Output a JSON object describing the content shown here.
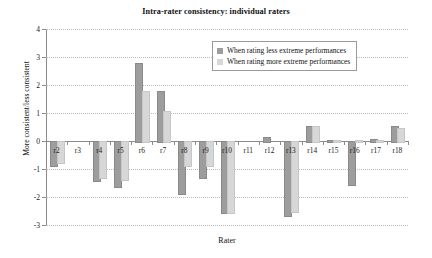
{
  "chart_data": {
    "type": "bar",
    "title": "Intra-rater consistency: individual raters",
    "xlabel": "Rater",
    "ylabel": "More consistent/less consistent",
    "ylim": [
      -3,
      4
    ],
    "yticks": [
      4,
      3,
      2,
      1,
      0,
      -1,
      -2,
      -3
    ],
    "ytick_labels": [
      "4",
      "3",
      "2",
      "1",
      "0",
      "-1",
      "-2",
      "-3"
    ],
    "grid": true,
    "legend_position": "upper-right-inside",
    "categories": [
      "r2",
      "r3",
      "r4",
      "r5",
      "r6",
      "r7",
      "r8",
      "r9",
      "r10",
      "r11",
      "r12",
      "r13",
      "r14",
      "r15",
      "r16",
      "r17",
      "r18"
    ],
    "series": [
      {
        "name": "When rating less extreme performances",
        "color": "#9d9d9d",
        "values": [
          -0.85,
          0,
          -1.4,
          -1.6,
          2.78,
          1.8,
          -1.85,
          -1.3,
          -2.55,
          0,
          0.15,
          -2.65,
          0.55,
          0.02,
          -1.55,
          0.07,
          0.55
        ]
      },
      {
        "name": "When rating more extreme performances",
        "color": "#d7d7d7",
        "values": [
          -0.75,
          0,
          -1.3,
          -1.35,
          1.78,
          1.08,
          -0.85,
          -0.85,
          -2.55,
          0,
          0,
          -2.5,
          0.52,
          0.03,
          0.05,
          0.02,
          0.45
        ]
      }
    ]
  }
}
